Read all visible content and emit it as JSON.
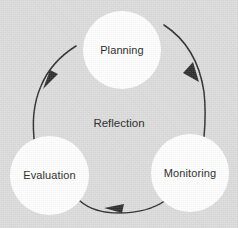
{
  "diagram": {
    "title": "Reflection",
    "center_label": "Reflection",
    "background_color": "#dcdcdc",
    "node_fill_color": "#ffffff",
    "text_color": "#1c1c1c",
    "arrow_color": "#2b2b2b",
    "cycle_direction": "Planning to Monitoring to Evaluation to Planning",
    "nodes": [
      {
        "id": "planning",
        "label": "Planning"
      },
      {
        "id": "monitoring",
        "label": "Monitoring"
      },
      {
        "id": "evaluation",
        "label": "Evaluation"
      }
    ],
    "arrows": [
      {
        "id": "planning-to-monitoring",
        "from": "Planning",
        "to": "Monitoring"
      },
      {
        "id": "monitoring-to-evaluation",
        "from": "Monitoring",
        "to": "Evaluation"
      },
      {
        "id": "evaluation-to-planning",
        "from": "Evaluation",
        "to": "Planning"
      }
    ]
  }
}
